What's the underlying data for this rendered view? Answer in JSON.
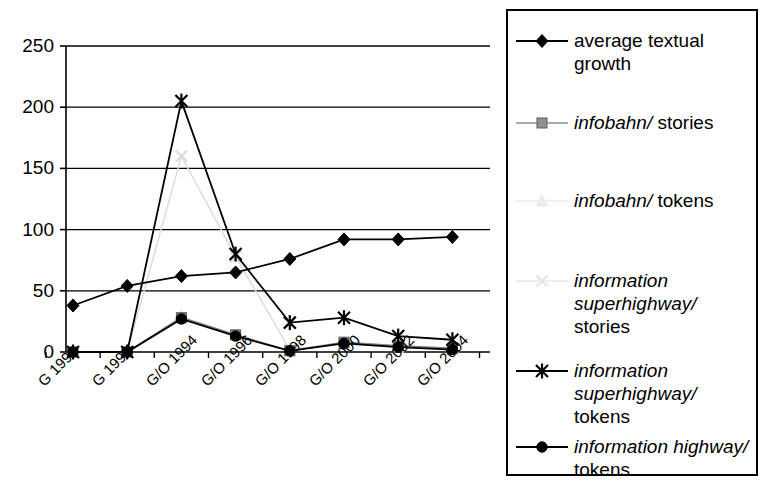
{
  "chart_data": {
    "type": "line",
    "title": "",
    "xlabel": "",
    "ylabel": "",
    "categories": [
      "G 1990",
      "G 1992",
      "G/O 1994",
      "G/O 1996",
      "G/O 1998",
      "G/O 2000",
      "G/O 2002",
      "G/O 2004"
    ],
    "ylim": [
      0,
      250
    ],
    "yticks": [
      0,
      50,
      100,
      150,
      200,
      250
    ],
    "grid": true,
    "legend_position": "right",
    "series": [
      {
        "name": "average textual growth",
        "marker": "diamond",
        "color": "#000000",
        "values": [
          38,
          54,
          62,
          65,
          76,
          92,
          92,
          94
        ]
      },
      {
        "name": "infobahn/ stories",
        "marker": "square",
        "color": "#808080",
        "values": [
          0,
          0,
          28,
          14,
          1,
          8,
          5,
          3
        ]
      },
      {
        "name": "infobahn/ tokens",
        "marker": "triangle",
        "color": "#e2e2e2",
        "values": [
          0,
          0,
          29,
          14,
          1,
          8,
          5,
          3
        ]
      },
      {
        "name": "information superhighway/ stories",
        "marker": "cross",
        "color": "#dcdcdc",
        "values": [
          0,
          0,
          160,
          78,
          2,
          7,
          4,
          2
        ]
      },
      {
        "name": "information superhighway/ tokens",
        "marker": "asterisk",
        "color": "#000000",
        "values": [
          0,
          0,
          205,
          80,
          24,
          28,
          13,
          10
        ]
      },
      {
        "name": "information highway/ tokens",
        "marker": "circle",
        "color": "#000000",
        "values": [
          0,
          0,
          27,
          13,
          1,
          7,
          4,
          2
        ]
      }
    ]
  },
  "axis": {
    "y_ticks": [
      "250",
      "200",
      "150",
      "100",
      "50",
      "0"
    ],
    "x_ticks": [
      "G 1990",
      "G 1992",
      "G/O 1994",
      "G/O 1996",
      "G/O 1998",
      "G/O 2000",
      "G/O 2002",
      "G/O 2004"
    ]
  },
  "legend": {
    "items": [
      {
        "label": "average textual growth",
        "italic_part": "",
        "plain_part": "average textual\ngrowth",
        "marker": "diamond"
      },
      {
        "label": "infobahn/ stories",
        "italic_part": "infobahn/",
        "plain_part": " stories",
        "marker": "square"
      },
      {
        "label": "infobahn/ tokens",
        "italic_part": "infobahn/",
        "plain_part": " tokens",
        "marker": "triangle"
      },
      {
        "label": "information superhighway/ stories",
        "italic_part": "information\nsuperhighway/",
        "plain_part": "\nstories",
        "marker": "cross"
      },
      {
        "label": "information superhighway/ tokens",
        "italic_part": "information\nsuperhighway/",
        "plain_part": "\ntokens",
        "marker": "asterisk"
      },
      {
        "label": "information highway/ tokens",
        "italic_part": "information highway/",
        "plain_part": "\ntokens",
        "marker": "circle"
      }
    ]
  }
}
